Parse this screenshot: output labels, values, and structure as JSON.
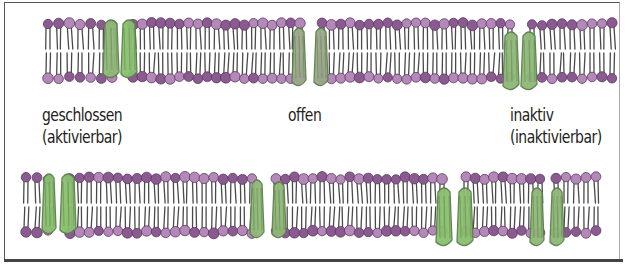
{
  "figure": {
    "type": "ion-channel-states-diagram",
    "colors": {
      "lipid_head": "#8a5a90",
      "lipid_head_light": "#b488b8",
      "lipid_tail": "#4a4a4a",
      "protein": "#8fb878",
      "protein_dark": "#5d7f4c",
      "frame": "#555555",
      "background": "#ffffff",
      "text": "#222222"
    }
  },
  "labels": {
    "closed": {
      "line1": "geschlossen",
      "line2": "(aktivierbar)"
    },
    "open": {
      "line1": "offen"
    },
    "inactive": {
      "line1": "inaktiv",
      "line2": "(inaktivierbar)"
    }
  },
  "membranes": [
    {
      "name": "top-row",
      "top": 24,
      "bottom": 78,
      "segments": [
        {
          "x1": 48,
          "x2": 112
        },
        {
          "x1": 133,
          "x2": 300
        },
        {
          "x1": 322,
          "x2": 510
        },
        {
          "x1": 532,
          "x2": 612
        }
      ],
      "proteins": [
        {
          "x": 103,
          "w": 16,
          "top": 18,
          "bottom": 80,
          "shade": "light"
        },
        {
          "x": 121,
          "w": 16,
          "top": 18,
          "bottom": 80,
          "shade": "bright"
        },
        {
          "x": 292,
          "w": 14,
          "top": 26,
          "bottom": 88,
          "shade": "dark"
        },
        {
          "x": 314,
          "w": 14,
          "top": 26,
          "bottom": 88,
          "shade": "dark"
        },
        {
          "x": 503,
          "w": 16,
          "top": 30,
          "bottom": 92,
          "shade": "light"
        },
        {
          "x": 521,
          "w": 16,
          "top": 30,
          "bottom": 92,
          "shade": "light"
        }
      ]
    },
    {
      "name": "bottom-row",
      "top": 178,
      "bottom": 232,
      "segments": [
        {
          "x1": 26,
          "x2": 48
        },
        {
          "x1": 70,
          "x2": 252
        },
        {
          "x1": 276,
          "x2": 442
        },
        {
          "x1": 466,
          "x2": 540
        },
        {
          "x1": 556,
          "x2": 596
        }
      ],
      "proteins": [
        {
          "x": 42,
          "w": 14,
          "top": 172,
          "bottom": 236,
          "shade": "bright"
        },
        {
          "x": 60,
          "w": 16,
          "top": 172,
          "bottom": 236,
          "shade": "bright"
        },
        {
          "x": 250,
          "w": 14,
          "top": 178,
          "bottom": 240,
          "shade": "light"
        },
        {
          "x": 272,
          "w": 14,
          "top": 180,
          "bottom": 240,
          "shade": "light"
        },
        {
          "x": 436,
          "w": 16,
          "top": 186,
          "bottom": 248,
          "shade": "bright"
        },
        {
          "x": 457,
          "w": 16,
          "top": 186,
          "bottom": 248,
          "shade": "bright"
        },
        {
          "x": 530,
          "w": 14,
          "top": 186,
          "bottom": 248,
          "shade": "light"
        },
        {
          "x": 550,
          "w": 14,
          "top": 186,
          "bottom": 248,
          "shade": "light"
        }
      ]
    }
  ]
}
